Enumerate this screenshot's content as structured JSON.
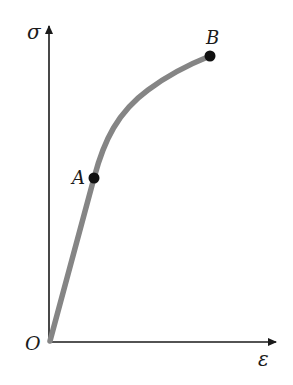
{
  "diagram": {
    "type": "stress-strain-curve",
    "axes": {
      "y_label": "σ",
      "x_label": "ε",
      "origin_label": "O"
    },
    "points": [
      {
        "label": "A",
        "description": "end of linear region"
      },
      {
        "label": "B",
        "description": "end of curve"
      }
    ],
    "colors": {
      "curve": "#858585",
      "axes": "#1a1a1a",
      "points": "#111111"
    }
  }
}
